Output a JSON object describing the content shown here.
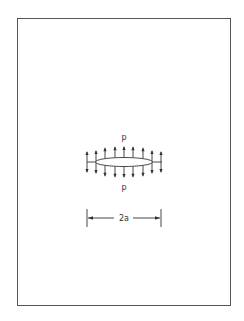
{
  "figure": {
    "type": "crack-under-internal-pressure",
    "frame": {
      "x": 17,
      "y": 18,
      "width": 214,
      "height": 288,
      "color": "#555555"
    },
    "crack": {
      "center_x": 124,
      "center_y": 162,
      "half_width": 28.5,
      "half_height": 5,
      "tail_left_x": 87,
      "tail_right_x": 162
    },
    "pressure_arrows": {
      "x_positions": [
        87,
        96,
        105,
        115,
        124,
        133,
        143,
        152,
        161
      ],
      "length": 10
    },
    "labels": {
      "pressure_top": "p",
      "pressure_bottom": "p",
      "dimension": "2a"
    },
    "dimension_line": {
      "x1": 87,
      "x2": 161,
      "y": 218
    },
    "ink_color": "#333333"
  }
}
